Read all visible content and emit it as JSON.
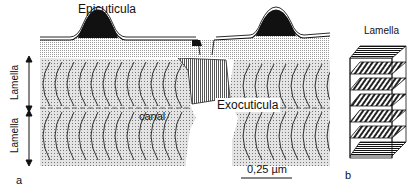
{
  "panel_a": {
    "letter": "a",
    "labels": {
      "epicuticula": "Epicuticula",
      "exocuticula": "Exocuticula",
      "canal": "canal",
      "lamella_upper": "Lamella",
      "lamella_lower": "Lamella"
    },
    "scale_bar": "0,25 µm"
  },
  "panel_b": {
    "letter": "b",
    "title": "Lamella",
    "layers": 7
  }
}
